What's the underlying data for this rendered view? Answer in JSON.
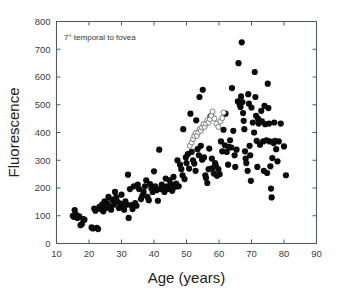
{
  "chart_data": {
    "type": "scatter",
    "title": "",
    "xlabel": "Age (years)",
    "ylabel": "Fluorescence",
    "annotation": "7° temporal to fovea",
    "xlim": [
      10,
      90
    ],
    "ylim": [
      0,
      800
    ],
    "xticks": [
      10,
      20,
      30,
      40,
      50,
      60,
      70,
      80,
      90
    ],
    "yticks": [
      0,
      100,
      200,
      300,
      400,
      500,
      600,
      700,
      800
    ],
    "grid": false,
    "legend": "none",
    "series": [
      {
        "name": "individual subjects",
        "marker": "filled-circle",
        "color": "#0a0a0a",
        "points": [
          [
            15.0,
            100
          ],
          [
            15.3,
            96
          ],
          [
            15.6,
            120
          ],
          [
            16.0,
            104
          ],
          [
            16.4,
            92
          ],
          [
            17.0,
            98
          ],
          [
            17.4,
            66
          ],
          [
            17.8,
            70
          ],
          [
            18.2,
            88
          ],
          [
            18.6,
            86
          ],
          [
            20.8,
            58
          ],
          [
            21.2,
            54
          ],
          [
            21.6,
            126
          ],
          [
            22.0,
            118
          ],
          [
            22.4,
            56
          ],
          [
            22.8,
            52
          ],
          [
            23.2,
            132
          ],
          [
            23.6,
            124
          ],
          [
            24.0,
            140
          ],
          [
            24.4,
            116
          ],
          [
            24.8,
            152
          ],
          [
            25.2,
            128
          ],
          [
            25.6,
            146
          ],
          [
            26.0,
            168
          ],
          [
            26.4,
            134
          ],
          [
            26.8,
            122
          ],
          [
            27.2,
            158
          ],
          [
            27.6,
            140
          ],
          [
            28.0,
            186
          ],
          [
            28.4,
            166
          ],
          [
            28.8,
            150
          ],
          [
            29.2,
            128
          ],
          [
            29.6,
            144
          ],
          [
            30.0,
            176
          ],
          [
            30.4,
            136
          ],
          [
            30.8,
            122
          ],
          [
            31.2,
            152
          ],
          [
            31.6,
            140
          ],
          [
            32.0,
            248
          ],
          [
            32.2,
            92
          ],
          [
            32.6,
            196
          ],
          [
            33.0,
            138
          ],
          [
            33.4,
            124
          ],
          [
            33.8,
            206
          ],
          [
            34.2,
            146
          ],
          [
            34.6,
            136
          ],
          [
            35.0,
            212
          ],
          [
            35.4,
            196
          ],
          [
            36.0,
            160
          ],
          [
            36.4,
            172
          ],
          [
            36.8,
            186
          ],
          [
            37.2,
            206
          ],
          [
            37.6,
            228
          ],
          [
            38.0,
            168
          ],
          [
            38.4,
            156
          ],
          [
            38.8,
            214
          ],
          [
            39.2,
            198
          ],
          [
            39.6,
            186
          ],
          [
            40.0,
            260
          ],
          [
            40.4,
            206
          ],
          [
            40.8,
            192
          ],
          [
            41.2,
            154
          ],
          [
            41.6,
            338
          ],
          [
            42.0,
            196
          ],
          [
            42.4,
            212
          ],
          [
            42.8,
            200
          ],
          [
            43.2,
            186
          ],
          [
            43.6,
            234
          ],
          [
            44.0,
            206
          ],
          [
            44.4,
            196
          ],
          [
            44.8,
            228
          ],
          [
            45.2,
            212
          ],
          [
            45.6,
            190
          ],
          [
            46.0,
            240
          ],
          [
            46.4,
            204
          ],
          [
            46.8,
            216
          ],
          [
            47.2,
            300
          ],
          [
            47.6,
            206
          ],
          [
            48.0,
            284
          ],
          [
            48.4,
            268
          ],
          [
            48.8,
            246
          ],
          [
            49.0,
            412
          ],
          [
            49.4,
            232
          ],
          [
            49.8,
            310
          ],
          [
            50.0,
            290
          ],
          [
            50.4,
            322
          ],
          [
            50.8,
            270
          ],
          [
            51.2,
            468
          ],
          [
            51.6,
            330
          ],
          [
            52.0,
            300
          ],
          [
            52.4,
            288
          ],
          [
            52.8,
            262
          ],
          [
            53.0,
            444
          ],
          [
            53.4,
            340
          ],
          [
            53.8,
            318
          ],
          [
            54.0,
            528
          ],
          [
            54.4,
            352
          ],
          [
            54.8,
            302
          ],
          [
            55.0,
            554
          ],
          [
            55.4,
            310
          ],
          [
            55.8,
            246
          ],
          [
            56.0,
            236
          ],
          [
            56.4,
            218
          ],
          [
            56.8,
            268
          ],
          [
            57.0,
            342
          ],
          [
            57.4,
            458
          ],
          [
            57.8,
            306
          ],
          [
            58.0,
            272
          ],
          [
            58.4,
            252
          ],
          [
            58.8,
            290
          ],
          [
            59.0,
            282
          ],
          [
            59.4,
            244
          ],
          [
            59.8,
            268
          ],
          [
            60.2,
            250
          ],
          [
            60.6,
            368
          ],
          [
            61.0,
            332
          ],
          [
            61.4,
            410
          ],
          [
            61.8,
            354
          ],
          [
            62.0,
            468
          ],
          [
            62.4,
            330
          ],
          [
            62.8,
            284
          ],
          [
            63.0,
            348
          ],
          [
            63.4,
            372
          ],
          [
            63.8,
            346
          ],
          [
            64.0,
            560
          ],
          [
            64.4,
            406
          ],
          [
            64.8,
            318
          ],
          [
            65.0,
            276
          ],
          [
            65.4,
            338
          ],
          [
            65.8,
            512
          ],
          [
            66.0,
            650
          ],
          [
            66.4,
            500
          ],
          [
            66.6,
            492
          ],
          [
            66.8,
            530
          ],
          [
            67.0,
            725
          ],
          [
            67.2,
            510
          ],
          [
            67.4,
            470
          ],
          [
            67.6,
            442
          ],
          [
            67.8,
            412
          ],
          [
            68.0,
            332
          ],
          [
            68.2,
            306
          ],
          [
            68.4,
            290
          ],
          [
            68.8,
            262
          ],
          [
            69.0,
            538
          ],
          [
            69.2,
            504
          ],
          [
            69.4,
            352
          ],
          [
            69.6,
            318
          ],
          [
            69.8,
            226
          ],
          [
            70.0,
            490
          ],
          [
            70.4,
            436
          ],
          [
            70.8,
            400
          ],
          [
            71.0,
            618
          ],
          [
            71.2,
            528
          ],
          [
            71.4,
            460
          ],
          [
            71.6,
            370
          ],
          [
            71.8,
            276
          ],
          [
            72.0,
            450
          ],
          [
            72.2,
            432
          ],
          [
            72.6,
            356
          ],
          [
            73.0,
            478
          ],
          [
            73.2,
            440
          ],
          [
            73.6,
            368
          ],
          [
            73.8,
            262
          ],
          [
            74.0,
            496
          ],
          [
            74.2,
            430
          ],
          [
            74.6,
            372
          ],
          [
            74.8,
            254
          ],
          [
            75.0,
            576
          ],
          [
            75.2,
            488
          ],
          [
            75.4,
            432
          ],
          [
            75.6,
            368
          ],
          [
            75.8,
            278
          ],
          [
            76.0,
            198
          ],
          [
            76.2,
            166
          ],
          [
            76.4,
            308
          ],
          [
            76.8,
            362
          ],
          [
            77.0,
            436
          ],
          [
            77.2,
            370
          ],
          [
            77.6,
            340
          ],
          [
            78.0,
            296
          ],
          [
            78.4,
            368
          ],
          [
            79.0,
            432
          ],
          [
            80.0,
            350
          ],
          [
            80.6,
            246
          ]
        ]
      },
      {
        "name": "mean trend (connected open symbols)",
        "marker": "open-circle",
        "color": "#8b9195",
        "connected": true,
        "points": [
          [
            51.0,
            352
          ],
          [
            51.6,
            364
          ],
          [
            52.0,
            376
          ],
          [
            52.4,
            388
          ],
          [
            52.8,
            398
          ],
          [
            53.2,
            388
          ],
          [
            53.6,
            400
          ],
          [
            54.0,
            412
          ],
          [
            54.4,
            406
          ],
          [
            54.8,
            418
          ],
          [
            55.2,
            430
          ],
          [
            55.6,
            420
          ],
          [
            56.0,
            432
          ],
          [
            56.4,
            444
          ],
          [
            56.8,
            436
          ],
          [
            57.2,
            448
          ],
          [
            57.6,
            460
          ],
          [
            58.0,
            476
          ],
          [
            58.6,
            450
          ],
          [
            59.2,
            432
          ],
          [
            59.8,
            420
          ],
          [
            60.4,
            440
          ],
          [
            61.0,
            452
          ],
          [
            61.4,
            472
          ]
        ]
      }
    ]
  }
}
